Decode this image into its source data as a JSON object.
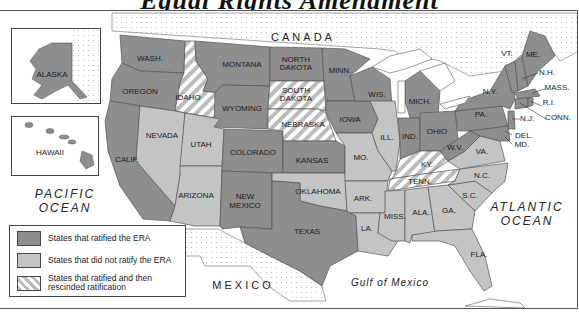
{
  "title": "Equal Rights Amendment",
  "colors": {
    "ratified": "#8e8e8e",
    "not_ratified": "#c4c4c4",
    "rescinded_stripe": "#b8b8b8",
    "foreign_land_dots": "#bdbdbd",
    "water": "#ffffff",
    "border": "#555555"
  },
  "labels": {
    "canada": "CANADA",
    "mexico": "MEXICO",
    "pacific": [
      "PACIFIC",
      "OCEAN"
    ],
    "atlantic": [
      "ATLANTIC",
      "OCEAN"
    ],
    "gulf": "Gulf of Mexico",
    "alaska": "ALASKA",
    "hawaii": "HAWAII"
  },
  "legend": {
    "items": [
      {
        "key": "ratified",
        "label": "States that ratified the ERA"
      },
      {
        "key": "not_ratified",
        "label": "States that did not ratify the ERA"
      },
      {
        "key": "rescinded",
        "label_line1": "States that ratified and then",
        "label_line2": "rescinded ratification"
      }
    ]
  },
  "states": {
    "ratified": [
      "WASH.",
      "OREGON",
      "CALIF.",
      "MONTANA",
      "WYOMING",
      "COLORADO",
      "NEW MEXICO",
      "NORTH DAKOTA",
      "KANSAS",
      "TEXAS",
      "MINN.",
      "IOWA",
      "WIS.",
      "MICH.",
      "IND.",
      "OHIO",
      "W.V.",
      "PA.",
      "N.Y.",
      "VT.",
      "ME.",
      "N.H.",
      "MASS.",
      "R.I.",
      "CONN.",
      "N.J.",
      "DEL.",
      "MD.",
      "ALASKA",
      "HAWAII"
    ],
    "not_ratified": [
      "NEVADA",
      "UTAH",
      "ARIZONA",
      "OKLAHOMA",
      "MO.",
      "ILL.",
      "ARK.",
      "LA.",
      "MISS.",
      "ALA.",
      "GA.",
      "FLA.",
      "S.C.",
      "N.C.",
      "VA."
    ],
    "rescinded": [
      "IDAHO",
      "SOUTH DAKOTA",
      "NEBRASKA",
      "KY.",
      "TENN."
    ]
  },
  "map_labels": {
    "wash": "WASH.",
    "oregon": "OREGON",
    "calif": "CALIF.",
    "idaho": "IDAHO",
    "nevada": "NEVADA",
    "montana": "MONTANA",
    "wyoming": "WYOMING",
    "utah": "UTAH",
    "arizona": "ARIZONA",
    "colorado": "COLORADO",
    "new": "NEW",
    "mexico_state": "MEXICO",
    "north": "NORTH",
    "dakota": "DAKOTA",
    "south": "SOUTH",
    "nebraska": "NEBRASKA",
    "kansas": "KANSAS",
    "oklahoma": "OKLAHOMA",
    "texas": "TEXAS",
    "minn": "MINN.",
    "iowa": "IOWA",
    "mo": "MO.",
    "ark": "ARK.",
    "la": "LA.",
    "wis": "WIS.",
    "ill": "ILL.",
    "mich": "MICH.",
    "ind": "IND.",
    "ohio": "OHIO",
    "ky": "KY.",
    "tenn": "TENN.",
    "miss": "MISS.",
    "ala": "ALA.",
    "ga": "GA.",
    "fla": "FLA.",
    "sc": "S.C.",
    "nc": "N.C.",
    "va": "VA.",
    "wv": "W.V.",
    "pa": "PA.",
    "ny": "N.Y.",
    "vt": "VT.",
    "me": "ME.",
    "nh": "N.H.",
    "mass": "MASS.",
    "ri": "R.I.",
    "conn": "CONN.",
    "nj": "N.J.",
    "del": "DEL.",
    "md": "MD."
  }
}
